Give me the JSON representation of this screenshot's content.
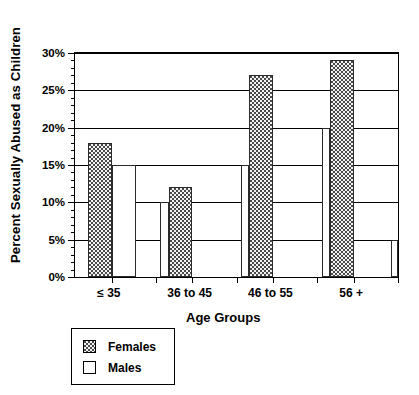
{
  "chart_data": {
    "type": "bar",
    "title": "",
    "xlabel": "Age Groups",
    "ylabel": "Percent Sexually Abused as Children",
    "categories": [
      "≤ 35",
      "36 to 45",
      "46 to 55",
      "56 +"
    ],
    "series": [
      {
        "name": "Females",
        "values": [
          18,
          12,
          27,
          29
        ],
        "pattern": "dotted",
        "color": "#f2f2f2"
      },
      {
        "name": "Males",
        "values": [
          15,
          10,
          15,
          20
        ],
        "pattern": "solid",
        "color": "#ffffff"
      }
    ],
    "trailing_male_bar": 5,
    "ylim": [
      0,
      30
    ],
    "yticks": [
      0,
      5,
      10,
      15,
      20,
      25,
      30
    ],
    "ytick_labels": [
      "0%",
      "5%",
      "10%",
      "15%",
      "20%",
      "25%",
      "30%"
    ],
    "grid": true,
    "grid_axis": "y",
    "legend_position": "below-left",
    "value_suffix": "%"
  },
  "legend": {
    "entries": [
      {
        "label": "Females",
        "swatch": "dotted-swatch"
      },
      {
        "label": "Males",
        "swatch": "white-swatch"
      }
    ]
  },
  "axes": {
    "x_title": "Age Groups",
    "y_title": "Percent Sexually Abused as Children"
  }
}
